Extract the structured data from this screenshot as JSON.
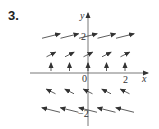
{
  "problem_number": "3.",
  "axes": {
    "x_label": "x",
    "y_label": "y",
    "origin_label": "0",
    "x_tick_label": "2",
    "y_tick_pos_label": "2",
    "y_tick_neg_label": "−2"
  },
  "colors": {
    "ink": "#333333",
    "axis": "#555555"
  },
  "vector_field": {
    "x_values": [
      -2,
      -1,
      0,
      1,
      2
    ],
    "rows": [
      {
        "y": 2,
        "vector": [
          2,
          0.5
        ],
        "description": "long arrows pointing right, slightly up"
      },
      {
        "y": 1,
        "vector": [
          1,
          0.5
        ],
        "description": "arrows pointing up-right"
      },
      {
        "y": 0,
        "vector": [
          0,
          0.4
        ],
        "description": "short arrows pointing straight up"
      },
      {
        "y": -1,
        "vector": [
          -1,
          0.5
        ],
        "description": "arrows pointing up-left"
      },
      {
        "y": -2,
        "vector": [
          -2,
          0.5
        ],
        "description": "long arrows pointing left, slightly up"
      }
    ]
  }
}
